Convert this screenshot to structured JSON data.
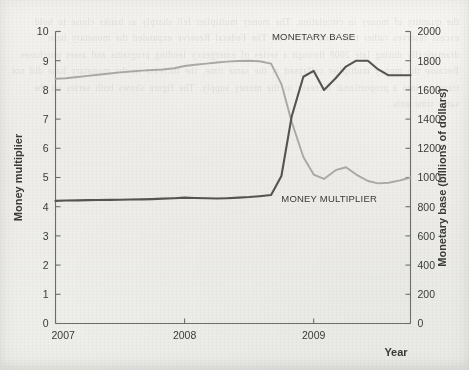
{
  "figure": {
    "background_color": "#f1f0ec",
    "bleed_text": "the quantity of money in circulation. The money multiplier fell sharply as banks chose to hold excess reserves rather than lend them out. The Federal Reserve expanded the monetary base dramatically during late 2008 through a series of emergency lending programs and asset purchases. Because the money multiplier collapsed at the same time, the increase in the monetary base did not translate into a proportional increase in the money supply. The figure shows both series on the same time axis."
  },
  "chart_data": {
    "type": "line",
    "title": "",
    "xlabel": "Year",
    "ylabel": "Money multiplier",
    "y2label": "Monetary base (billions of dollars)",
    "grid": false,
    "legend_position": "inline-annotations",
    "xlim": [
      2007.0,
      2009.75
    ],
    "x_ticks": [
      2007,
      2008,
      2009
    ],
    "x_tick_labels": [
      "2007",
      "2008",
      "2009"
    ],
    "ylim": [
      0,
      10
    ],
    "y_ticks": [
      0,
      1,
      2,
      3,
      4,
      5,
      6,
      7,
      8,
      9,
      10
    ],
    "y_tick_labels": [
      "0",
      "1",
      "2",
      "3",
      "4",
      "5",
      "6",
      "7",
      "8",
      "9",
      "10"
    ],
    "y2lim": [
      0,
      2000
    ],
    "y2_ticks": [
      0,
      200,
      400,
      600,
      800,
      1000,
      1200,
      1400,
      1600,
      1800,
      2000
    ],
    "y2_tick_labels": [
      "0",
      "200",
      "400",
      "600",
      "800",
      "1000",
      "1200",
      "1400",
      "1600",
      "1800",
      "2000"
    ],
    "series": [
      {
        "name": "MONEY MULTIPLIER",
        "axis": "left",
        "color": "#a9a9a5",
        "linewidth": 1.9,
        "annotation": "MONEY MULTIPLIER",
        "x": [
          2007.0,
          2007.08,
          2007.17,
          2007.25,
          2007.33,
          2007.42,
          2007.5,
          2007.58,
          2007.67,
          2007.75,
          2007.83,
          2007.92,
          2008.0,
          2008.08,
          2008.17,
          2008.25,
          2008.33,
          2008.42,
          2008.5,
          2008.58,
          2008.67,
          2008.75,
          2008.83,
          2008.92,
          2009.0,
          2009.08,
          2009.17,
          2009.25,
          2009.33,
          2009.42,
          2009.5,
          2009.58,
          2009.67,
          2009.75
        ],
        "y": [
          8.38,
          8.4,
          8.44,
          8.48,
          8.52,
          8.56,
          8.6,
          8.63,
          8.66,
          8.68,
          8.7,
          8.74,
          8.82,
          8.86,
          8.9,
          8.94,
          8.97,
          8.99,
          9.0,
          8.98,
          8.9,
          8.2,
          6.9,
          5.7,
          5.1,
          4.95,
          5.25,
          5.35,
          5.1,
          4.88,
          4.8,
          4.82,
          4.9,
          5.0
        ]
      },
      {
        "name": "MONETARY BASE",
        "axis": "right",
        "color": "#55554f",
        "linewidth": 2.1,
        "annotation": "MONETARY BASE",
        "x": [
          2007.0,
          2007.08,
          2007.17,
          2007.25,
          2007.33,
          2007.42,
          2007.5,
          2007.58,
          2007.67,
          2007.75,
          2007.83,
          2007.92,
          2008.0,
          2008.08,
          2008.17,
          2008.25,
          2008.33,
          2008.42,
          2008.5,
          2008.58,
          2008.67,
          2008.75,
          2008.83,
          2008.92,
          2009.0,
          2009.08,
          2009.17,
          2009.25,
          2009.33,
          2009.42,
          2009.5,
          2009.58,
          2009.67,
          2009.75
        ],
        "y": [
          840,
          842,
          843,
          845,
          846,
          847,
          848,
          849,
          850,
          852,
          855,
          858,
          862,
          860,
          858,
          856,
          858,
          862,
          866,
          872,
          880,
          1010,
          1420,
          1690,
          1730,
          1600,
          1680,
          1760,
          1800,
          1800,
          1740,
          1700,
          1700,
          1700
        ]
      }
    ],
    "annotations": [
      {
        "text": "MONETARY BASE",
        "x": 2009.0,
        "y2": 1940
      },
      {
        "text": "MONEY MULTIPLIER",
        "x": 2009.12,
        "y": 4.15
      }
    ]
  },
  "axis_titles": {
    "left": "Money multiplier",
    "right": "Monetary base (billions of dollars)",
    "bottom": "Year"
  }
}
